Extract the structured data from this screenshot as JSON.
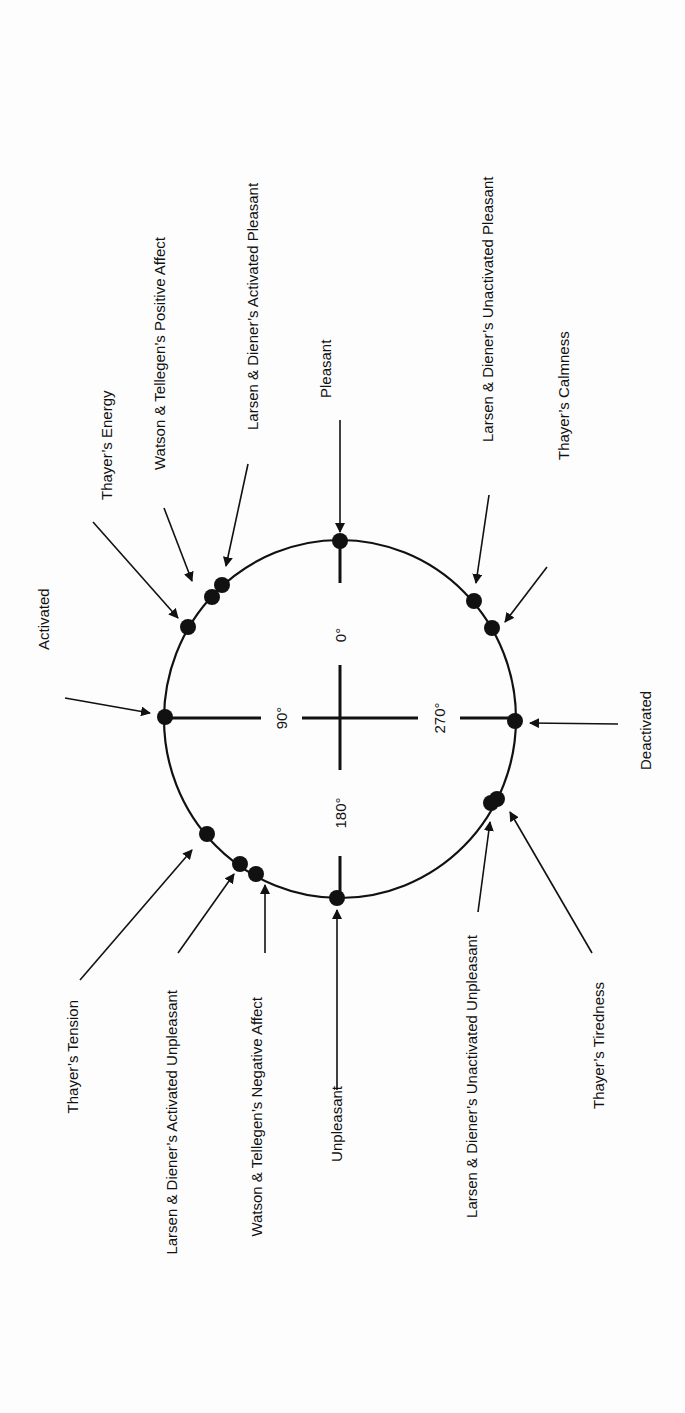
{
  "diagram": {
    "axes": {
      "deg0": "0°",
      "deg90": "90°",
      "deg180": "180°",
      "deg270": "270°"
    },
    "poles": {
      "pleasant": "Pleasant",
      "unpleasant": "Unpleasant",
      "activated": "Activated",
      "deactivated": "Deactivated"
    },
    "constructs": {
      "thayer_energy": "Thayer’s Energy",
      "wt_positive_affect": "Watson & Tellegen’s Positive Affect",
      "ld_activated_pleasant": "Larsen & Diener’s Activated Pleasant",
      "ld_unactivated_pleasant": "Larsen & Diener’s Unactivated Pleasant",
      "thayer_calmness": "Thayer’s Calmness",
      "thayer_tension": "Thayer’s Tension",
      "ld_activated_unpleasant": "Larsen & Diener’s Activated Unpleasant",
      "wt_negative_affect": "Watson & Tellegen’s Negative Affect",
      "ld_unactivated_unpleasant": "Larsen & Diener’s Unactivated Unpleasant",
      "thayer_tiredness": "Thayer’s Tiredness"
    },
    "colors": {
      "ink": "#111111",
      "background": "#fdfdfd"
    }
  }
}
